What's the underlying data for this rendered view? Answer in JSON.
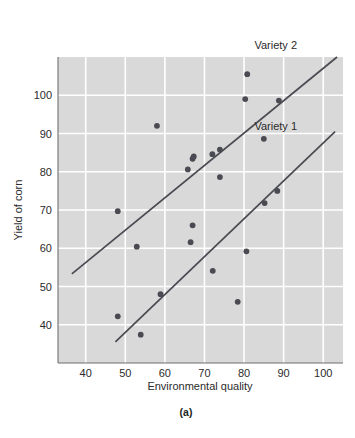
{
  "figure": {
    "caption": "(a)",
    "background": "#ffffff",
    "plot_background": "#d9d9d9",
    "grid_color": "#ffffff",
    "axis_color": "#808080",
    "point_color": "#4a4a52",
    "line_color": "#4a4a52"
  },
  "chart_data": {
    "type": "scatter",
    "title": "",
    "xlabel": "Environmental quality",
    "ylabel": "Yield of corn",
    "xlim": [
      33,
      105
    ],
    "ylim": [
      30,
      110
    ],
    "xticks": [
      40,
      50,
      60,
      70,
      80,
      90,
      100
    ],
    "yticks": [
      40,
      50,
      60,
      70,
      80,
      90,
      100
    ],
    "xtick_labels": [
      "40",
      "50",
      "60",
      "70",
      "80",
      "90",
      "100"
    ],
    "ytick_labels": [
      "40",
      "50",
      "60",
      "70",
      "80",
      "90",
      "100"
    ],
    "grid": true,
    "legend_position": "inline-annotation",
    "annotations": [
      {
        "text": "Variety 2",
        "x": 88,
        "y": 112
      },
      {
        "text": "Variety 1",
        "x": 88,
        "y": 91
      }
    ],
    "series": [
      {
        "name": "Variety 2",
        "marker": "circle",
        "points": [
          {
            "x": 48.1,
            "y": 69.7
          },
          {
            "x": 58.0,
            "y": 92.0
          },
          {
            "x": 65.8,
            "y": 80.6
          },
          {
            "x": 67.0,
            "y": 83.4
          },
          {
            "x": 67.3,
            "y": 84.0
          },
          {
            "x": 72.0,
            "y": 84.6
          },
          {
            "x": 73.9,
            "y": 85.8
          },
          {
            "x": 80.8,
            "y": 105.5
          },
          {
            "x": 80.3,
            "y": 99.0
          },
          {
            "x": 85.0,
            "y": 88.6
          },
          {
            "x": 88.8,
            "y": 98.6
          }
        ]
      },
      {
        "name": "Variety 1",
        "marker": "circle",
        "points": [
          {
            "x": 48.1,
            "y": 42.2
          },
          {
            "x": 52.9,
            "y": 60.4
          },
          {
            "x": 53.9,
            "y": 37.4
          },
          {
            "x": 58.9,
            "y": 48.0
          },
          {
            "x": 66.5,
            "y": 61.6
          },
          {
            "x": 67.0,
            "y": 66.0
          },
          {
            "x": 73.9,
            "y": 78.6
          },
          {
            "x": 72.1,
            "y": 54.1
          },
          {
            "x": 78.4,
            "y": 46.0
          },
          {
            "x": 80.6,
            "y": 59.2
          },
          {
            "x": 85.2,
            "y": 71.8
          },
          {
            "x": 88.4,
            "y": 75.0
          }
        ]
      }
    ],
    "trend_lines": [
      {
        "name": "Variety 2",
        "x0": 36.5,
        "y0": 53.3,
        "x1": 103.5,
        "y1": 110.0
      },
      {
        "name": "Variety 1",
        "x0": 47.5,
        "y0": 35.5,
        "x1": 103.0,
        "y1": 90.5
      }
    ]
  }
}
